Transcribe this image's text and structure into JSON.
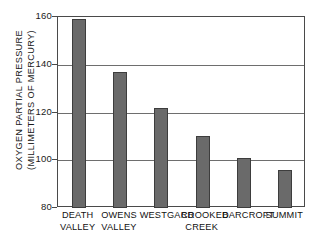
{
  "chart_data": {
    "type": "bar",
    "title": "",
    "xlabel": "",
    "ylabel": "OXYGEN PARTIAL PRESSURE (MILLIMETERS OF MERCURY)",
    "ylabel_lines": [
      "OXYGEN PARTIAL PRESSURE",
      "(MILLIMETERS OF MERCURY)"
    ],
    "categories": [
      "DEATH VALLEY",
      "OWENS VALLEY",
      "WESTGARD",
      "CROOKED CREEK",
      "BARCROFT",
      "SUMMIT"
    ],
    "category_lines": [
      [
        "DEATH",
        "VALLEY"
      ],
      [
        "OWENS",
        "VALLEY"
      ],
      [
        "WESTGARD",
        ""
      ],
      [
        "CROOKED",
        "CREEK"
      ],
      [
        "BARCROFT",
        ""
      ],
      [
        "SUMMIT",
        ""
      ]
    ],
    "values": [
      159,
      137,
      122,
      110,
      101,
      96
    ],
    "ylim": [
      80,
      160
    ],
    "yticks": [
      80,
      100,
      120,
      140,
      160
    ],
    "ytick_labels": [
      "80",
      "100",
      "120",
      "140",
      "160"
    ],
    "grid": true,
    "grid_axis": "y",
    "legend": null,
    "bar_color": "#6a6a6a",
    "bar_edge_color": "#3d3d3d",
    "axis_color": "#4a4a4a",
    "grid_color": "#6e6e6e",
    "background_color": "#ffffff"
  }
}
